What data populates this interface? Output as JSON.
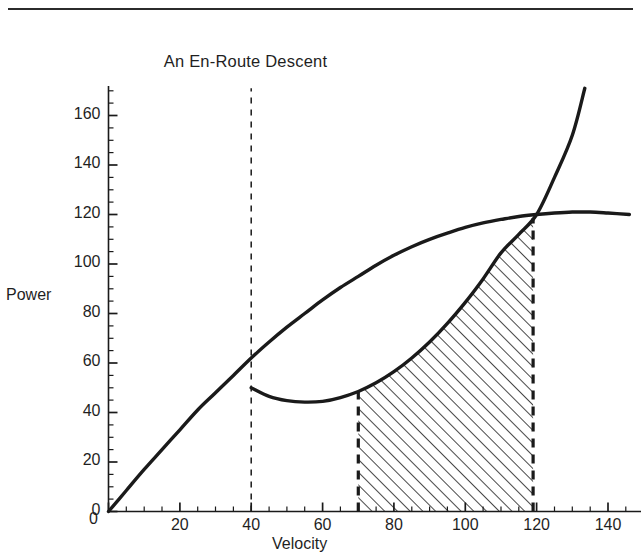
{
  "figure": {
    "title": "An En-Route Descent",
    "rule_color": "#2b2b2b"
  },
  "chart_data": {
    "type": "line",
    "title": "An En-Route Descent",
    "xlabel": "Velocity",
    "ylabel": "Power",
    "xlim": [
      0,
      146
    ],
    "ylim": [
      0,
      171
    ],
    "grid": false,
    "legend": "none",
    "x_ticks_major": [
      0,
      20,
      40,
      60,
      80,
      100,
      120,
      140
    ],
    "x_tick_labels": [
      "0",
      "20",
      "40",
      "60",
      "80",
      "100",
      "120",
      "140"
    ],
    "x_minor_step": 5,
    "y_ticks_major": [
      0,
      20,
      40,
      60,
      80,
      100,
      120,
      140,
      160
    ],
    "y_tick_labels": [
      "0",
      "20",
      "40",
      "60",
      "80",
      "100",
      "120",
      "140",
      "160"
    ],
    "y_minor_step": 5,
    "line_color": "#1a1a1a",
    "series": [
      {
        "name": "power-available",
        "style": "solid",
        "points": [
          [
            0,
            0
          ],
          [
            5,
            8.5
          ],
          [
            10,
            17
          ],
          [
            15,
            25
          ],
          [
            20,
            33
          ],
          [
            25,
            41
          ],
          [
            30,
            48
          ],
          [
            35,
            55
          ],
          [
            40,
            62
          ],
          [
            45,
            68.5
          ],
          [
            50,
            74.5
          ],
          [
            55,
            80
          ],
          [
            60,
            85.5
          ],
          [
            65,
            90.5
          ],
          [
            70,
            95
          ],
          [
            75,
            99.5
          ],
          [
            80,
            103.5
          ],
          [
            85,
            107
          ],
          [
            90,
            110
          ],
          [
            95,
            112.5
          ],
          [
            100,
            114.8
          ],
          [
            105,
            116.6
          ],
          [
            110,
            118
          ],
          [
            115,
            119.2
          ],
          [
            120,
            120
          ],
          [
            125,
            120.6
          ],
          [
            130,
            121
          ],
          [
            135,
            121
          ],
          [
            140,
            120.6
          ],
          [
            146,
            120
          ]
        ]
      },
      {
        "name": "power-required",
        "style": "solid",
        "points": [
          [
            40,
            50
          ],
          [
            45,
            46.5
          ],
          [
            50,
            44.8
          ],
          [
            55,
            44.2
          ],
          [
            60,
            44.5
          ],
          [
            65,
            46
          ],
          [
            70,
            48.5
          ],
          [
            75,
            52
          ],
          [
            80,
            56.5
          ],
          [
            85,
            62
          ],
          [
            90,
            68.5
          ],
          [
            95,
            76
          ],
          [
            100,
            84.5
          ],
          [
            105,
            94
          ],
          [
            110,
            104.5
          ],
          [
            115,
            112
          ],
          [
            120,
            120
          ],
          [
            125,
            135
          ],
          [
            130,
            152
          ],
          [
            133.5,
            171
          ]
        ]
      }
    ],
    "vertical_markers": [
      {
        "name": "descent-entry",
        "x": 40,
        "style": "dashed-thin",
        "y_from": 0,
        "y_to": 171
      },
      {
        "name": "shaded-left-edge",
        "x": 70,
        "style": "dashed-thick",
        "y_from": 0,
        "y_to": 48.5
      },
      {
        "name": "shaded-right-edge",
        "x": 119,
        "style": "dashed-thick",
        "y_from": 0,
        "y_to": 118.5
      }
    ],
    "shaded_region": {
      "name": "excess-power-region",
      "hatch": "45-degree",
      "x_from": 70,
      "x_to": 119,
      "bounded_below_by": "x-axis",
      "bounded_above_by": "power-required"
    }
  },
  "y_axis": {
    "label": "Power",
    "labels": [
      {
        "value": "160",
        "y": 160
      },
      {
        "value": "140",
        "y": 140
      },
      {
        "value": "120",
        "y": 120
      },
      {
        "value": "100",
        "y": 100
      },
      {
        "value": "80",
        "y": 80
      },
      {
        "value": "60",
        "y": 60
      },
      {
        "value": "40",
        "y": 40
      },
      {
        "value": "20",
        "y": 20
      },
      {
        "value": "0",
        "y": 0
      }
    ]
  },
  "x_axis": {
    "label": "Velocity",
    "labels": [
      {
        "value": "0",
        "x": 0
      },
      {
        "value": "20",
        "x": 20
      },
      {
        "value": "40",
        "x": 40
      },
      {
        "value": "60",
        "x": 60
      },
      {
        "value": "80",
        "x": 80
      },
      {
        "value": "100",
        "x": 100
      },
      {
        "value": "120",
        "x": 120
      },
      {
        "value": "140",
        "x": 140
      }
    ]
  }
}
